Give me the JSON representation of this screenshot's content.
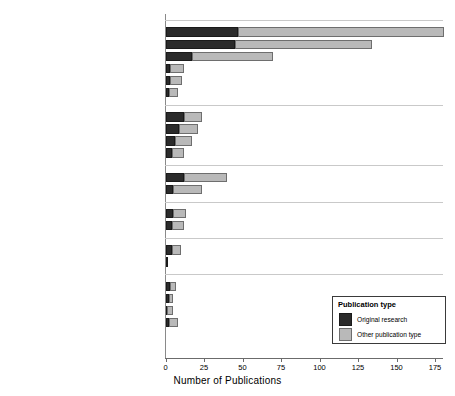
{
  "chart_data": {
    "type": "bar",
    "orientation": "horizontal",
    "stacked": true,
    "title": "",
    "xlabel": "Number of Publications",
    "ylabel": "",
    "xlim": [
      0,
      180
    ],
    "xticks": [
      0,
      25,
      50,
      75,
      100,
      125,
      150,
      175
    ],
    "xticklabels": [
      "0",
      "25",
      "50",
      "75",
      "100",
      "125",
      "150",
      "175"
    ],
    "grid": false,
    "legend": {
      "title": "Publication type",
      "position": "lower right",
      "entries": [
        {
          "name": "Original research",
          "color": "#2b2b2b"
        },
        {
          "name": "Other publication type",
          "color": "#b9b9b9"
        }
      ]
    },
    "series": [
      {
        "name": "Original research",
        "color": "#2b2b2b"
      },
      {
        "name": "Other publication type",
        "color": "#b9b9b9"
      }
    ],
    "groups": [
      {
        "label": "Physical",
        "categories": [
          {
            "label": "Mobility",
            "values": [
              47,
              134
            ]
          },
          {
            "label": "Physical rehabilitation",
            "values": [
              45,
              89
            ]
          },
          {
            "label": "Activities of daily living",
            "values": [
              17,
              53
            ]
          },
          {
            "label": "Feeding/eating/swallowing",
            "values": [
              3,
              9
            ]
          },
          {
            "label": "Splinting",
            "values": [
              3,
              8
            ]
          },
          {
            "label": "Skin care",
            "values": [
              2,
              6
            ]
          }
        ]
      },
      {
        "label": "Environmental",
        "categories": [
          {
            "label": "Augmentative and alternative communication",
            "values": [
              12,
              12
            ]
          },
          {
            "label": "Seating and wheelchair",
            "values": [
              9,
              12
            ]
          },
          {
            "label": "Environmental modifications/adaptations",
            "values": [
              6,
              11
            ]
          },
          {
            "label": "Assistive devices",
            "values": [
              4,
              8
            ]
          }
        ]
      },
      {
        "label": "Cognitive",
        "categories": [
          {
            "label": "Delirium prevention and care",
            "values": [
              12,
              28
            ]
          },
          {
            "label": "Cognitive assessment and intervention",
            "values": [
              5,
              19
            ]
          }
        ]
      },
      {
        "label": "Social or emotional",
        "categories": [
          {
            "label": "Mental health/Psychosocial/Coping",
            "values": [
              5,
              8
            ]
          },
          {
            "label": "Family support/Goal setting",
            "values": [
              4,
              8
            ]
          }
        ]
      },
      {
        "label": "Sensory",
        "categories": [
          {
            "label": "Sensory stimulation",
            "values": [
              4,
              6
            ]
          },
          {
            "label": "Music Therapy",
            "values": [
              1,
              0
            ]
          }
        ]
      },
      {
        "label": "Other types",
        "categories": [
          {
            "label": "Discharge planning",
            "values": [
              3,
              4
            ]
          },
          {
            "label": "Sleep",
            "values": [
              2,
              3
            ]
          },
          {
            "label": "Education",
            "values": [
              1,
              4
            ]
          },
          {
            "label": "Other",
            "values": [
              2,
              6
            ]
          }
        ]
      }
    ]
  }
}
